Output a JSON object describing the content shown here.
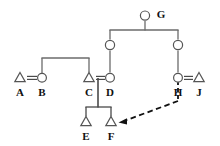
{
  "diagram": {
    "type": "kinship-chart",
    "colors": {
      "line": "#6b6b6b",
      "marriage_line": "#4a4a4a",
      "node_stroke": "#555555",
      "adoption_line": "#111111",
      "label_text": "#111111",
      "background": "#ffffff"
    },
    "legend_symbols": {
      "triangle": "male",
      "circle": "female",
      "equals": "marriage",
      "dashed_arrow": "adoption-or-fosterage"
    },
    "persons": [
      {
        "id": "A",
        "label": "A",
        "symbol": "triangle",
        "sex": "male",
        "x": 20,
        "y": 78,
        "label_x": 20,
        "label_y": 92
      },
      {
        "id": "B",
        "label": "B",
        "symbol": "circle",
        "sex": "female",
        "x": 42,
        "y": 78,
        "label_x": 42,
        "label_y": 92
      },
      {
        "id": "C",
        "label": "C",
        "symbol": "triangle",
        "sex": "male",
        "x": 89,
        "y": 78,
        "label_x": 89,
        "label_y": 92
      },
      {
        "id": "D",
        "label": "D",
        "symbol": "circle",
        "sex": "female",
        "x": 110,
        "y": 78,
        "label_x": 110,
        "label_y": 92
      },
      {
        "id": "E",
        "label": "E",
        "symbol": "triangle",
        "sex": "male",
        "x": 86,
        "y": 122,
        "label_x": 86,
        "label_y": 136
      },
      {
        "id": "F",
        "label": "F",
        "symbol": "triangle",
        "sex": "male",
        "x": 111,
        "y": 122,
        "label_x": 111,
        "label_y": 136
      },
      {
        "id": "G",
        "label": "G",
        "symbol": "circle",
        "sex": "female",
        "x": 145,
        "y": 15,
        "label_x": 161,
        "label_y": 15
      },
      {
        "id": "H",
        "label": "H",
        "symbol": "circle",
        "sex": "female",
        "x": 178,
        "y": 78,
        "label_x": 178,
        "label_y": 92
      },
      {
        "id": "J",
        "label": "J",
        "symbol": "triangle",
        "sex": "male",
        "x": 199,
        "y": 78,
        "label_x": 199,
        "label_y": 92
      },
      {
        "id": "P1",
        "label": "",
        "symbol": "circle",
        "sex": "female",
        "x": 110,
        "y": 45,
        "label_x": 0,
        "label_y": 0
      },
      {
        "id": "P2",
        "label": "",
        "symbol": "circle",
        "sex": "female",
        "x": 178,
        "y": 45,
        "label_x": 0,
        "label_y": 0
      }
    ],
    "marriages": [
      {
        "id": "A-B",
        "left": "A",
        "right": "B",
        "style": "solid",
        "y": 78,
        "x1": 27,
        "x2": 37
      },
      {
        "id": "C-D",
        "left": "C",
        "right": "D",
        "style": "solid",
        "y": 78,
        "x1": 96,
        "x2": 105
      },
      {
        "id": "H-J",
        "left": "H",
        "right": "J",
        "style": "solid",
        "y": 78,
        "x1": 184,
        "x2": 193
      }
    ],
    "descent_links": [
      {
        "id": "ab-to-c",
        "kind": "sibling-bar",
        "bar_y": 58,
        "bar_x1": 42,
        "bar_x2": 89,
        "drop_from_y": 58,
        "drop_to_y": 72
      },
      {
        "id": "g-children",
        "kind": "sibling-bar",
        "bar_y": 30,
        "bar_x1": 110,
        "bar_x2": 178,
        "drop_from_y": 30,
        "drop_to_y": 39
      },
      {
        "id": "g-stem",
        "kind": "vertical",
        "x": 145,
        "y1": 21,
        "y2": 30
      },
      {
        "id": "p1-to-d",
        "kind": "vertical",
        "x": 110,
        "y1": 51,
        "y2": 72
      },
      {
        "id": "p2-to-h",
        "kind": "vertical",
        "x": 178,
        "y1": 51,
        "y2": 72
      },
      {
        "id": "cd-stem",
        "kind": "vertical",
        "x": 98,
        "y1": 78,
        "y2": 107
      },
      {
        "id": "ef-bar",
        "kind": "sibling-bar",
        "bar_y": 107,
        "bar_x1": 86,
        "bar_x2": 111,
        "drop_from_y": 107,
        "drop_to_y": 116
      }
    ],
    "adoption_link": {
      "id": "hj-to-f",
      "style": "dashed",
      "from_label": "H=J",
      "to_label": "F",
      "vertical_x": 178,
      "vertical_y1": 80,
      "vertical_y2": 101,
      "arrow_x1": 178,
      "arrow_y1": 101,
      "arrow_x2": 120,
      "arrow_y2": 122
    }
  }
}
